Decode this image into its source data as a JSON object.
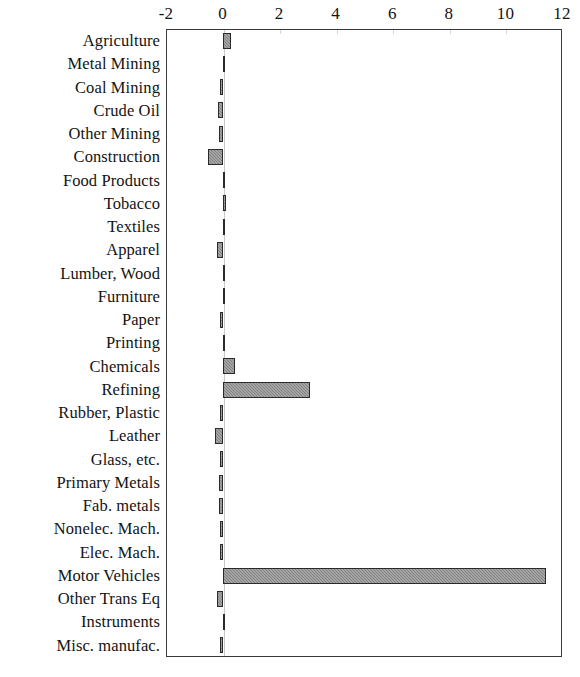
{
  "chart_data": {
    "type": "bar",
    "orientation": "horizontal",
    "title": "",
    "subtitle": "",
    "xlabel": "",
    "ylabel": "",
    "xlim": [
      -2,
      12
    ],
    "ylim": null,
    "grid": false,
    "legend": null,
    "xticks": [
      "-2",
      "0",
      "2",
      "4",
      "6",
      "8",
      "10",
      "12"
    ],
    "xtick_values": [
      -2,
      0,
      2,
      4,
      6,
      8,
      10,
      12
    ],
    "categories": [
      "Agriculture",
      "Metal Mining",
      "Coal Mining",
      "Crude Oil",
      "Other Mining",
      "Construction",
      "Food Products",
      "Tobacco",
      "Textiles",
      "Apparel",
      "Lumber, Wood",
      "Furniture",
      "Paper",
      "Printing",
      "Chemicals",
      "Refining",
      "Rubber, Plastic",
      "Leather",
      "Glass, etc.",
      "Primary Metals",
      "Fab. metals",
      "Nonelec. Mach.",
      "Elec. Mach.",
      "Motor Vehicles",
      "Other Trans Eq",
      "Instruments",
      "Misc. manufac."
    ],
    "values": [
      0.3,
      0.05,
      -0.07,
      -0.15,
      -0.12,
      -0.5,
      0.02,
      0.12,
      0.04,
      -0.2,
      0.1,
      0.01,
      -0.1,
      0.02,
      0.45,
      3.1,
      -0.07,
      -0.28,
      -0.05,
      -0.13,
      -0.14,
      -0.08,
      -0.05,
      11.45,
      -0.18,
      0.01,
      -0.02
    ],
    "bar_fill_color": "#8f8f8f",
    "bar_edge_color": "#2b2b2b",
    "axis_color": "#3a3a3a",
    "background_color": "#ffffff"
  }
}
